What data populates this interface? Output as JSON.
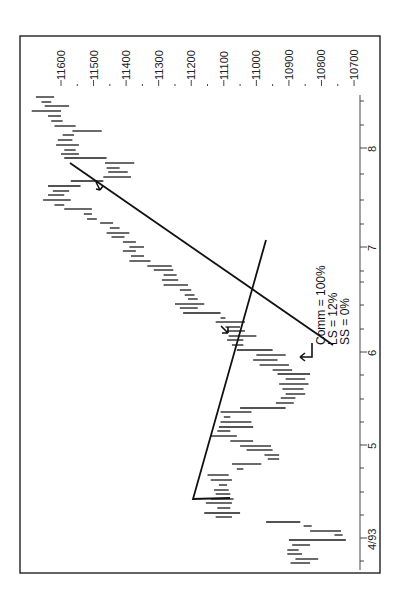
{
  "chart_data": {
    "type": "bar",
    "subtype": "ohlc-range-bars",
    "orientation": "rotated-90",
    "title": "",
    "xlabel": "",
    "ylabel": "",
    "price_axis": {
      "ticks": [
        "11600",
        "11500",
        "11400",
        "11300",
        "11200",
        "11100",
        "11000",
        "10900",
        "10800",
        "10700"
      ],
      "range": [
        10700,
        11600
      ]
    },
    "date_axis": {
      "ticks": [
        "4/93",
        "5",
        "6",
        "7",
        "8"
      ]
    },
    "annotation": {
      "lines": [
        "Comm = 100%",
        "LS = 12%",
        "SS = 0%"
      ]
    },
    "trendlines": [
      {
        "name": "upper-trendline",
        "from": {
          "date_px": 163,
          "price": 11575
        },
        "to": {
          "date_px": 345,
          "price": 10775
        }
      },
      {
        "name": "lower-trendline",
        "from": {
          "date_px": 499,
          "price": 11198
        },
        "to": {
          "date_px": 240,
          "price": 10960
        }
      }
    ],
    "bars": [
      {
        "y": 97,
        "high": 11677,
        "low": 11621
      },
      {
        "y": 102,
        "high": 11660,
        "low": 11630
      },
      {
        "y": 106,
        "high": 11650,
        "low": 11575
      },
      {
        "y": 111,
        "high": 11690,
        "low": 11600
      },
      {
        "y": 116,
        "high": 11640,
        "low": 11600
      },
      {
        "y": 121,
        "high": 11630,
        "low": 11595
      },
      {
        "y": 126,
        "high": 11620,
        "low": 11555
      },
      {
        "y": 131,
        "high": 11565,
        "low": 11475
      },
      {
        "y": 135,
        "high": 11595,
        "low": 11560
      },
      {
        "y": 140,
        "high": 11610,
        "low": 11565
      },
      {
        "y": 145,
        "high": 11615,
        "low": 11545
      },
      {
        "y": 150,
        "high": 11590,
        "low": 11555
      },
      {
        "y": 154,
        "high": 11600,
        "low": 11545
      },
      {
        "y": 158,
        "high": 11590,
        "low": 11460
      },
      {
        "y": 163,
        "high": 11465,
        "low": 11375
      },
      {
        "y": 168,
        "high": 11460,
        "low": 11420
      },
      {
        "y": 172,
        "high": 11455,
        "low": 11395
      },
      {
        "y": 177,
        "high": 11470,
        "low": 11385
      },
      {
        "y": 181,
        "high": 11570,
        "low": 11470
      },
      {
        "y": 186,
        "high": 11640,
        "low": 11540
      },
      {
        "y": 191,
        "high": 11625,
        "low": 11575
      },
      {
        "y": 195,
        "high": 11640,
        "low": 11590
      },
      {
        "y": 200,
        "high": 11655,
        "low": 11570
      },
      {
        "y": 205,
        "high": 11620,
        "low": 11590
      },
      {
        "y": 209,
        "high": 11590,
        "low": 11505
      },
      {
        "y": 214,
        "high": 11530,
        "low": 11505
      },
      {
        "y": 219,
        "high": 11520,
        "low": 11490
      },
      {
        "y": 223,
        "high": 11480,
        "low": 11440
      },
      {
        "y": 228,
        "high": 11450,
        "low": 11420
      },
      {
        "y": 233,
        "high": 11460,
        "low": 11390
      },
      {
        "y": 237,
        "high": 11445,
        "low": 11405
      },
      {
        "y": 242,
        "high": 11410,
        "low": 11370
      },
      {
        "y": 247,
        "high": 11390,
        "low": 11345
      },
      {
        "y": 251,
        "high": 11410,
        "low": 11370
      },
      {
        "y": 256,
        "high": 11385,
        "low": 11345
      },
      {
        "y": 261,
        "high": 11390,
        "low": 11325
      },
      {
        "y": 266,
        "high": 11335,
        "low": 11260
      },
      {
        "y": 270,
        "high": 11315,
        "low": 11255
      },
      {
        "y": 275,
        "high": 11285,
        "low": 11245
      },
      {
        "y": 280,
        "high": 11290,
        "low": 11240
      },
      {
        "y": 285,
        "high": 11285,
        "low": 11210
      },
      {
        "y": 290,
        "high": 11235,
        "low": 11200
      },
      {
        "y": 295,
        "high": 11220,
        "low": 11190
      },
      {
        "y": 299,
        "high": 11210,
        "low": 11180
      },
      {
        "y": 304,
        "high": 11250,
        "low": 11160
      },
      {
        "y": 308,
        "high": 11235,
        "low": 11180
      },
      {
        "y": 313,
        "high": 11225,
        "low": 11110
      },
      {
        "y": 318,
        "high": 11110,
        "low": 11095
      },
      {
        "y": 322,
        "high": 11125,
        "low": 11035
      },
      {
        "y": 327,
        "high": 11095,
        "low": 11050
      },
      {
        "y": 331,
        "high": 11090,
        "low": 11035
      },
      {
        "y": 336,
        "high": 11085,
        "low": 11000
      },
      {
        "y": 340,
        "high": 11090,
        "low": 11040
      },
      {
        "y": 345,
        "high": 11075,
        "low": 11040
      },
      {
        "y": 350,
        "high": 11060,
        "low": 10950
      },
      {
        "y": 355,
        "high": 11000,
        "low": 10910
      },
      {
        "y": 360,
        "high": 11010,
        "low": 10935
      },
      {
        "y": 365,
        "high": 10990,
        "low": 10900
      },
      {
        "y": 370,
        "high": 10950,
        "low": 10890
      },
      {
        "y": 374,
        "high": 10935,
        "low": 10835
      },
      {
        "y": 379,
        "high": 10910,
        "low": 10850
      },
      {
        "y": 384,
        "high": 10930,
        "low": 10840
      },
      {
        "y": 389,
        "high": 10920,
        "low": 10855
      },
      {
        "y": 394,
        "high": 10910,
        "low": 10850
      },
      {
        "y": 398,
        "high": 10925,
        "low": 10880
      },
      {
        "y": 403,
        "high": 10940,
        "low": 10885
      },
      {
        "y": 408,
        "high": 11050,
        "low": 10910
      },
      {
        "y": 412,
        "high": 11110,
        "low": 11015
      },
      {
        "y": 417,
        "high": 11100,
        "low": 11080
      },
      {
        "y": 422,
        "high": 11110,
        "low": 11015
      },
      {
        "y": 427,
        "high": 11115,
        "low": 11010
      },
      {
        "y": 431,
        "high": 11120,
        "low": 11080
      },
      {
        "y": 436,
        "high": 11140,
        "low": 11060
      },
      {
        "y": 441,
        "high": 11080,
        "low": 11010
      },
      {
        "y": 446,
        "high": 11050,
        "low": 10955
      },
      {
        "y": 450,
        "high": 11030,
        "low": 10950
      },
      {
        "y": 455,
        "high": 10975,
        "low": 10930
      },
      {
        "y": 459,
        "high": 10965,
        "low": 10930
      },
      {
        "y": 464,
        "high": 11075,
        "low": 10985
      },
      {
        "y": 469,
        "high": 11060,
        "low": 11040
      },
      {
        "y": 475,
        "high": 11150,
        "low": 11085
      },
      {
        "y": 480,
        "high": 11140,
        "low": 11075
      },
      {
        "y": 485,
        "high": 11115,
        "low": 11090
      },
      {
        "y": 490,
        "high": 11130,
        "low": 11085
      },
      {
        "y": 494,
        "high": 11125,
        "low": 11080
      },
      {
        "y": 499,
        "high": 11140,
        "low": 11070
      },
      {
        "y": 503,
        "high": 11155,
        "low": 11075
      },
      {
        "y": 508,
        "high": 11120,
        "low": 11080
      },
      {
        "y": 513,
        "high": 11160,
        "low": 11050
      },
      {
        "y": 517,
        "high": 11125,
        "low": 11075
      },
      {
        "y": 522,
        "high": 10970,
        "low": 10865
      },
      {
        "y": 526,
        "high": 10855,
        "low": 10830
      },
      {
        "y": 531,
        "high": 10835,
        "low": 10740
      },
      {
        "y": 535,
        "high": 10760,
        "low": 10735
      },
      {
        "y": 540,
        "high": 10900,
        "low": 10725
      },
      {
        "y": 545,
        "high": 10890,
        "low": 10835
      },
      {
        "y": 550,
        "high": 10905,
        "low": 10870
      },
      {
        "y": 554,
        "high": 10905,
        "low": 10860
      },
      {
        "y": 559,
        "high": 10880,
        "low": 10810
      },
      {
        "y": 563,
        "high": 10895,
        "low": 10835
      }
    ]
  },
  "layout_px": {
    "frame": {
      "x": 20,
      "y": 36,
      "w": 360,
      "h": 537
    },
    "price_to_x": {
      "origin_price": 11600,
      "origin_x": 61,
      "px_per_point": 0.3256
    },
    "date_ticks_y": [
      538,
      445,
      352,
      247,
      148
    ],
    "date_minor_ticks_y": [
      561,
      515,
      492,
      468,
      422,
      399,
      375,
      329,
      305,
      282,
      271,
      224,
      200,
      174,
      125,
      101
    ]
  }
}
